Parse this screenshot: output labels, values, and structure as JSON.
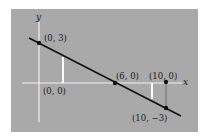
{
  "figure": {
    "background_color": "#ffffff",
    "panel_color": "#a9a9a9",
    "axis_color": "#f2f2f2",
    "line_color": "#111111",
    "axes": {
      "x_label": "x",
      "y_label": "y"
    },
    "line": {
      "description": "Line through (0, 3) and (6, 0)",
      "from_px": [
        29,
        38
      ],
      "to_px": [
        181,
        116
      ]
    },
    "points": [
      {
        "label": "(0, 3)",
        "x": 0,
        "y": 3
      },
      {
        "label": "(6, 0)",
        "x": 6,
        "y": 0
      },
      {
        "label": "(10, 0)",
        "x": 10,
        "y": 0
      },
      {
        "label": "(10, −3)",
        "x": 10,
        "y": -3
      }
    ],
    "origin_label": "(0, 0)",
    "vertical_segments": [
      {
        "name": "white-segment-left",
        "color": "#ffffff"
      },
      {
        "name": "white-segment-right",
        "color": "#ffffff"
      },
      {
        "name": "gray-segment-at-x10",
        "color": "#6e6e6e"
      }
    ]
  }
}
